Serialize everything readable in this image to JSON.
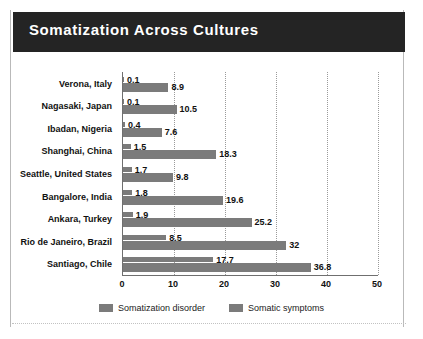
{
  "header": {
    "title": "Somatization Across Cultures"
  },
  "legend": {
    "entries": [
      {
        "label": "Somatization disorder",
        "color": "#7b7b7b"
      },
      {
        "label": "Somatic symptoms",
        "color": "#7b7b7b"
      }
    ]
  },
  "axis": {
    "ticks": [
      "0",
      "10",
      "20",
      "30",
      "40",
      "50"
    ]
  },
  "chart_data": {
    "type": "bar",
    "orientation": "horizontal",
    "title": "Somatization Across Cultures",
    "xlabel": "",
    "ylabel": "",
    "xlim": [
      0,
      50
    ],
    "grid": true,
    "legend_position": "bottom",
    "categories": [
      "Verona, Italy",
      "Nagasaki, Japan",
      "Ibadan, Nigeria",
      "Shanghai, China",
      "Seattle, United States",
      "Bangalore, India",
      "Ankara, Turkey",
      "Rio de Janeiro, Brazil",
      "Santiago, Chile"
    ],
    "series": [
      {
        "name": "Somatization disorder",
        "color": "#7b7b7b",
        "values": [
          0.1,
          0.1,
          0.4,
          1.5,
          1.7,
          1.8,
          1.9,
          8.5,
          17.7
        ],
        "labels": [
          "0.1",
          "0.1",
          "0.4",
          "1.5",
          "1.7",
          "1.8",
          "1.9",
          "8.5",
          "17.7"
        ]
      },
      {
        "name": "Somatic symptoms",
        "color": "#7b7b7b",
        "values": [
          8.9,
          10.5,
          7.6,
          18.3,
          9.8,
          19.6,
          25.2,
          32,
          36.8
        ],
        "labels": [
          "8.9",
          "10.5",
          "7.6",
          "18.3",
          "9.8",
          "19.6",
          "25.2",
          "32",
          "36.8"
        ]
      }
    ]
  }
}
